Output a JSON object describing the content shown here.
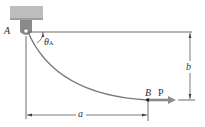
{
  "diagram": {
    "labels": {
      "point_a": "A",
      "point_b": "B",
      "angle": "θ",
      "angle_sub": "A",
      "force": "P",
      "dim_horizontal": "a",
      "dim_vertical": "b"
    },
    "colors": {
      "support": "#b9b9b9",
      "cable": "#7a7a7a",
      "force_arrow": "#8c8c8c",
      "lines": "#444444",
      "text": "#333333"
    }
  }
}
